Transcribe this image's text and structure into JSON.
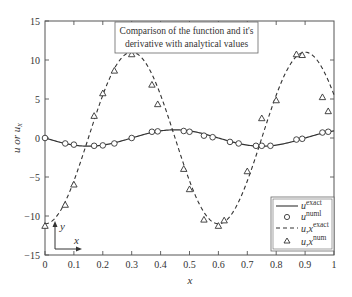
{
  "chart_data": {
    "type": "line",
    "title": "Comparison of the function and it's derivative with analytical values",
    "title_lines": [
      "Comparison of the function and it's",
      "derivative with analytical values"
    ],
    "xlabel": "x",
    "ylabel": "u or u_x",
    "xlim": [
      0,
      1
    ],
    "ylim": [
      -15,
      15
    ],
    "x_ticks": [
      "0",
      "0.1",
      "0.2",
      "0.3",
      "0.4",
      "0.5",
      "0.6",
      "0.7",
      "0.8",
      "0.9",
      "1"
    ],
    "y_ticks": [
      "15",
      "10",
      "5",
      "0",
      "−5",
      "−10",
      "−15"
    ],
    "grid": false,
    "legend_position": "lower right",
    "legend": [
      {
        "label": "u",
        "sup": "exact",
        "style": "solid line"
      },
      {
        "label": "u",
        "sup": "numl",
        "style": "circle marker"
      },
      {
        "label": "u,x",
        "sup": "exact",
        "style": "dashed line"
      },
      {
        "label": "u,x",
        "sup": "num",
        "style": "triangle marker"
      }
    ],
    "series": [
      {
        "name": "u exact",
        "style": "solid",
        "x": [
          0,
          0.05,
          0.1,
          0.15,
          0.2,
          0.25,
          0.3,
          0.35,
          0.4,
          0.45,
          0.5,
          0.55,
          0.6,
          0.65,
          0.7,
          0.75,
          0.8,
          0.85,
          0.9,
          0.95,
          1.0
        ],
        "values": [
          0,
          -0.51,
          -0.91,
          -1.05,
          -0.9,
          -0.51,
          0.0,
          0.51,
          0.91,
          1.05,
          0.9,
          0.51,
          0.0,
          -0.51,
          -0.91,
          -1.05,
          -0.9,
          -0.5,
          0.01,
          0.51,
          0.91
        ]
      },
      {
        "name": "u numl",
        "style": "circle",
        "x": [
          0,
          0.07,
          0.1,
          0.17,
          0.2,
          0.24,
          0.3,
          0.37,
          0.39,
          0.48,
          0.5,
          0.55,
          0.58,
          0.64,
          0.67,
          0.73,
          0.75,
          0.78,
          0.87,
          0.89,
          0.96,
          0.98
        ],
        "values": [
          0,
          -0.7,
          -0.85,
          -1.0,
          -0.95,
          -0.7,
          0.0,
          0.8,
          0.85,
          0.9,
          0.8,
          0.3,
          0.1,
          -0.5,
          -0.7,
          -1.0,
          -1.0,
          -1.0,
          -0.2,
          -0.1,
          0.7,
          0.8
        ]
      },
      {
        "name": "u,x exact",
        "style": "dashed",
        "x": [
          0,
          0.05,
          0.1,
          0.15,
          0.2,
          0.25,
          0.3,
          0.35,
          0.4,
          0.45,
          0.5,
          0.55,
          0.6,
          0.65,
          0.7,
          0.75,
          0.8,
          0.85,
          0.9,
          0.95,
          1.0
        ],
        "values": [
          -11.0,
          -9.48,
          -5.4,
          0.0,
          5.48,
          9.49,
          11.0,
          9.52,
          5.45,
          0.04,
          -5.41,
          -9.45,
          -11.0,
          -9.5,
          -5.5,
          -0.1,
          5.36,
          9.44,
          11.0,
          9.55,
          5.2
        ]
      },
      {
        "name": "u,x num",
        "style": "triangle",
        "x": [
          0,
          0.07,
          0.1,
          0.17,
          0.2,
          0.24,
          0.3,
          0.37,
          0.39,
          0.48,
          0.5,
          0.55,
          0.6,
          0.62,
          0.7,
          0.75,
          0.8,
          0.87,
          0.89,
          0.96,
          0.98
        ],
        "values": [
          -11.3,
          -8.6,
          -6.0,
          2.8,
          5.7,
          8.6,
          10.7,
          6.8,
          4.3,
          -4.0,
          -6.6,
          -10.5,
          -11.3,
          -10.6,
          -4.3,
          2.5,
          4.8,
          10.7,
          10.6,
          5.2,
          3.4
        ]
      }
    ],
    "inset_axes_icon": {
      "x_label": "x",
      "y_label": "y"
    }
  },
  "colors": {
    "axis": "#555555",
    "line": "#333333",
    "background": "#ffffff"
  }
}
